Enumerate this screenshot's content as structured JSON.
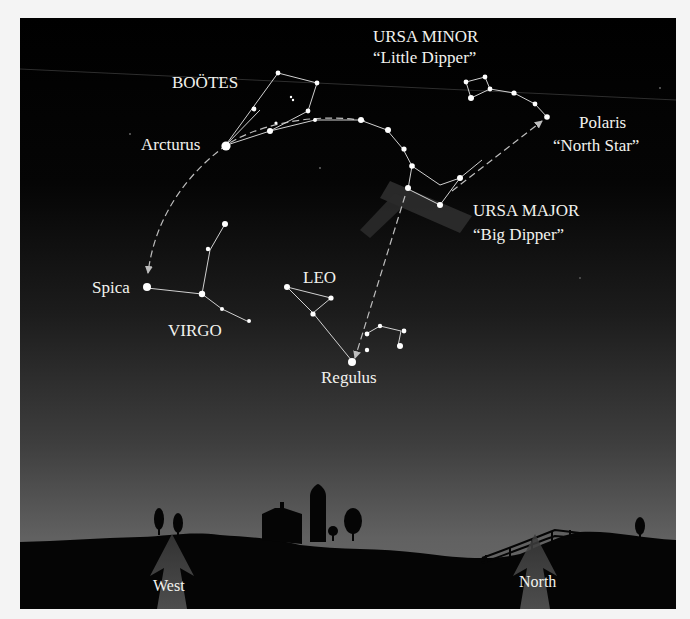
{
  "diagram": {
    "colors": {
      "sky_top": "#000000",
      "sky_mid": "#1e1e1e",
      "sky_bottom": "#6a6a6a",
      "ground": "#050505",
      "star": "#ffffff",
      "line": "#d8d8d8",
      "pointer_beam": "#3a3a3a",
      "direction_arrow": "#4a4a4a",
      "label": "#f2f2ee"
    },
    "constellations": {
      "ursa_minor": {
        "name": "URSA MINOR",
        "nickname": "“Little Dipper”"
      },
      "ursa_major": {
        "name": "URSA MAJOR",
        "nickname": "“Big Dipper”"
      },
      "bootes": {
        "name": "BOÖTES"
      },
      "leo": {
        "name": "LEO"
      },
      "virgo": {
        "name": "VIRGO"
      }
    },
    "stars": {
      "polaris": {
        "name": "Polaris",
        "nickname": "“North Star”"
      },
      "arcturus": {
        "name": "Arcturus"
      },
      "spica": {
        "name": "Spica"
      },
      "regulus": {
        "name": "Regulus"
      }
    },
    "directions": {
      "west": "West",
      "north": "North"
    }
  }
}
